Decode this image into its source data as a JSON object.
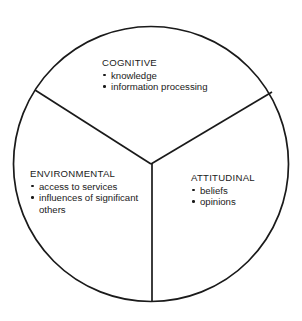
{
  "diagram": {
    "type": "three-sector-circle",
    "shape": "circle",
    "stroke_color": "#1a1a1a",
    "fill_color": "#ffffff",
    "text_color": "#1a1a1a",
    "geometry": {
      "center_x": 151,
      "center_y": 164,
      "radius": 138,
      "divider_endpoints": [
        {
          "x": 35,
          "y": 90
        },
        {
          "x": 272,
          "y": 92
        },
        {
          "x": 152,
          "y": 302
        }
      ]
    },
    "sectors": [
      {
        "id": "cognitive",
        "title": "COGNITIVE",
        "items": [
          "knowledge",
          "information processing"
        ]
      },
      {
        "id": "environmental",
        "title": "ENVIRONMENTAL",
        "items": [
          "access to services",
          "influences of significant others"
        ]
      },
      {
        "id": "attitudinal",
        "title": "ATTITUDINAL",
        "items": [
          "beliefs",
          "opinions"
        ]
      }
    ]
  }
}
